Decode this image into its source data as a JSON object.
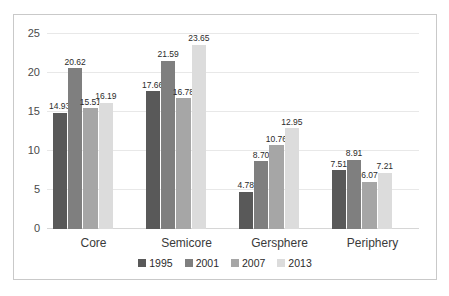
{
  "chart_data": {
    "type": "bar",
    "title": "",
    "subtitle": "",
    "xlabel": "",
    "ylabel": "",
    "categories": [
      "Core",
      "Semicore",
      "Gersphere",
      "Periphery"
    ],
    "series": [
      {
        "name": "1995",
        "color": "#595959",
        "values": [
          14.93,
          17.66,
          4.78,
          7.51
        ]
      },
      {
        "name": "2001",
        "color": "#7f7f7f",
        "values": [
          20.62,
          21.59,
          8.7,
          8.91
        ]
      },
      {
        "name": "2007",
        "color": "#a6a6a6",
        "values": [
          15.51,
          16.78,
          10.76,
          6.07
        ]
      },
      {
        "name": "2013",
        "color": "#dcdcdc",
        "values": [
          16.19,
          23.65,
          12.95,
          7.21
        ]
      }
    ],
    "value_labels": [
      [
        "14.93",
        "20.62",
        "15.51",
        "16.19"
      ],
      [
        "17.66",
        "21.59",
        "16.78",
        "23.65"
      ],
      [
        "4.78",
        "8.70",
        "10.76",
        "12.95"
      ],
      [
        "7.51",
        "8.91",
        "6.07",
        "7.21"
      ]
    ],
    "ylim": [
      0,
      25
    ],
    "yticks": [
      0,
      5,
      10,
      15,
      20,
      25
    ],
    "ytick_labels": [
      "0",
      "5",
      "10",
      "15",
      "20",
      "25"
    ],
    "grid": true,
    "legend_position": "bottom",
    "border": true,
    "background_color": "#ffffff",
    "border_color": "#c9c9c9",
    "grid_color": "#e8e8e8",
    "axis_color": "#d6d6d6"
  }
}
